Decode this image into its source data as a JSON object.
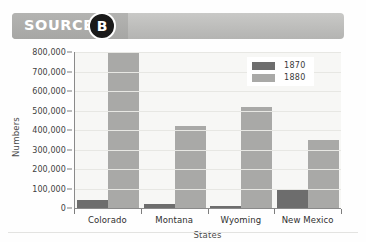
{
  "header": {
    "source_label": "SOURCE",
    "badge_letter": "B"
  },
  "legend": {
    "items": [
      {
        "label": "1870",
        "color": "#6d6d6d"
      },
      {
        "label": "1880",
        "color": "#a9a9a7"
      }
    ]
  },
  "axes": {
    "y_title": "Numbers",
    "x_title": "States",
    "y_ticks": [
      "800,000",
      "700,000",
      "600,000",
      "500,000",
      "400,000",
      "300,000",
      "200,000",
      "100,000",
      "0"
    ]
  },
  "chart_data": {
    "type": "bar",
    "title": "",
    "xlabel": "States",
    "ylabel": "Numbers",
    "ylim": [
      0,
      800000
    ],
    "ytick_step": 100000,
    "grid": true,
    "legend_position": "top-right",
    "categories": [
      "Colorado",
      "Montana",
      "Wyoming",
      "New Mexico"
    ],
    "series": [
      {
        "name": "1870",
        "color": "#6d6d6d",
        "values": [
          40000,
          21000,
          9000,
          92000
        ]
      },
      {
        "name": "1880",
        "color": "#a9a9a7",
        "values": [
          795000,
          420000,
          520000,
          350000
        ]
      }
    ]
  },
  "colors": {
    "banner": "#b3b3b1",
    "badge": "#1a1a1a",
    "plot_background": "#f7f7f5",
    "axis": "#8a8a8a"
  }
}
